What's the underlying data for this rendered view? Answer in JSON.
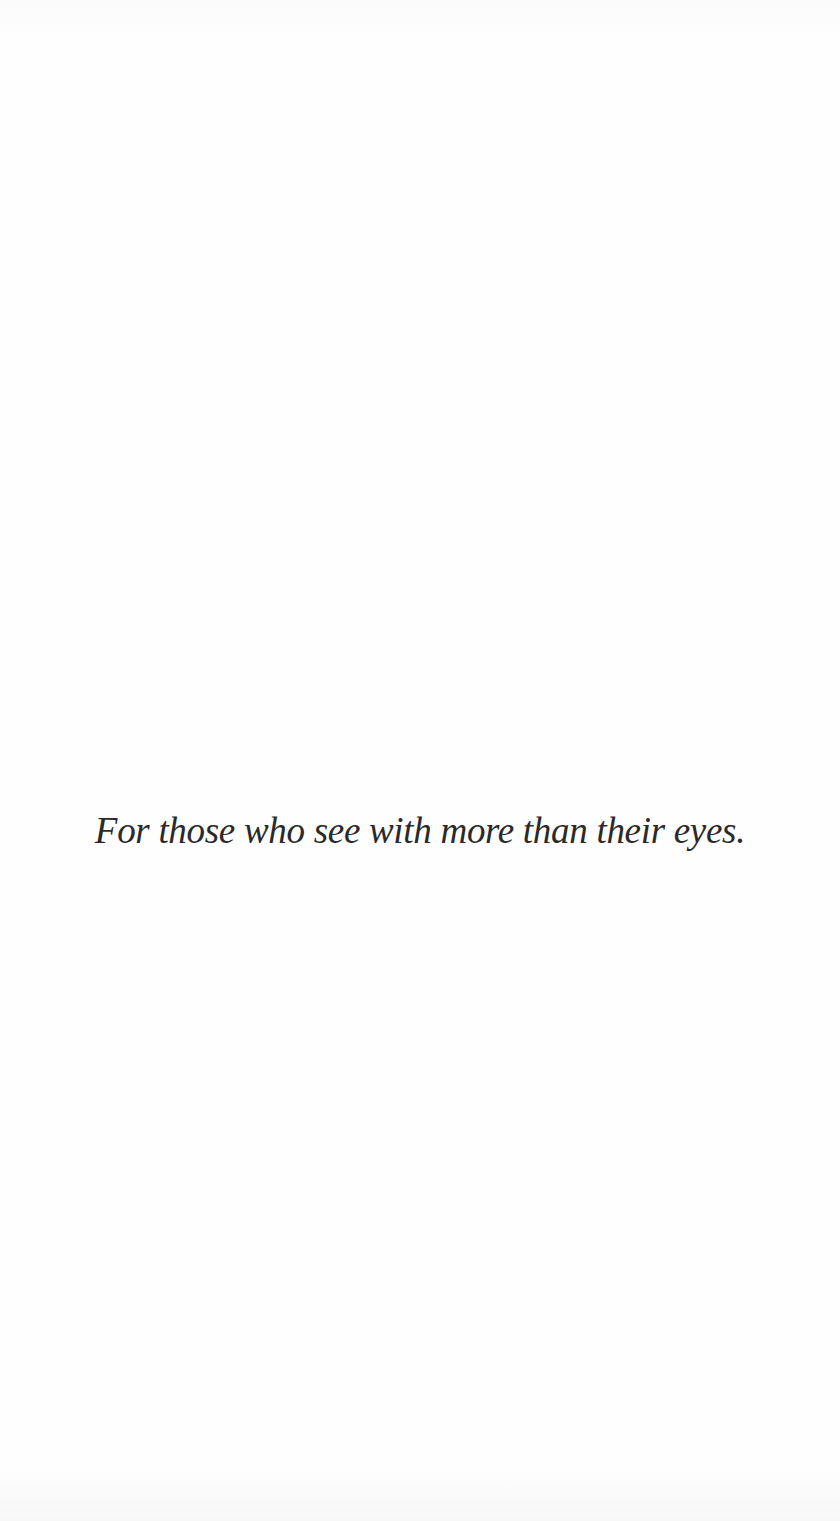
{
  "page": {
    "type": "dedication",
    "text": "For those who see with more than their eyes.",
    "background_color": "#fefefe",
    "text_color": "#2a2a2a"
  }
}
